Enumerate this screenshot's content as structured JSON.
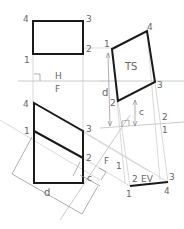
{
  "diagram": {
    "top_view": {
      "labels": {
        "p1": "1",
        "p2": "2",
        "p3": "3",
        "p4": "4"
      }
    },
    "fold_line_hf": {
      "upper": "H",
      "lower": "F"
    },
    "front_view": {
      "labels": {
        "p1": "1",
        "p2": "2",
        "p3": "3",
        "p4": "4"
      },
      "dims": {
        "c": "c",
        "d": "d"
      }
    },
    "fold_line_f1": {
      "label_f": "F",
      "label_1": "1"
    },
    "edge_view": {
      "label": "EV",
      "labels": {
        "p1": "1",
        "p2": "2",
        "p3": "3",
        "p4": "4"
      }
    },
    "fold_line_12": {
      "label_1": "1",
      "label_2": "2"
    },
    "true_size_view": {
      "label": "TS",
      "labels": {
        "p1": "1",
        "p2": "2",
        "p3": "3",
        "p4": "4"
      },
      "dims": {
        "c": "c",
        "d": "d"
      }
    },
    "colors": {
      "object": "#1a1a1a",
      "projection": "#cfcfcf",
      "dimension": "#8c8c8c",
      "text": "#666666"
    }
  }
}
